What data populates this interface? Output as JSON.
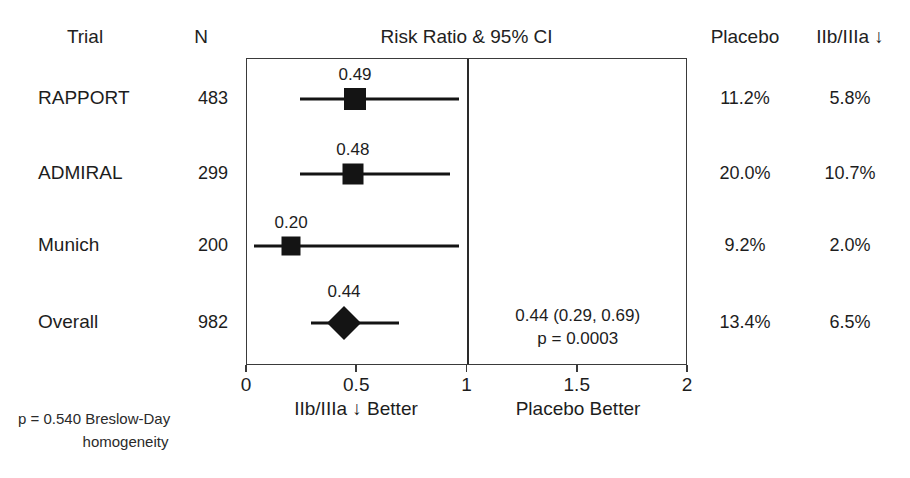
{
  "figure": {
    "width": 910,
    "height": 478,
    "background": "#ffffff",
    "ink": "#141414"
  },
  "headers": {
    "trial": "Trial",
    "n": "N",
    "plot_title": "Risk Ratio & 95% CI",
    "placebo": "Placebo",
    "active": "IIb/IIIa ↓"
  },
  "axis": {
    "min": 0,
    "max": 2,
    "null_value": 1,
    "ticks": [
      "0",
      "0.5",
      "1",
      "1.5",
      "2"
    ],
    "tick_values": [
      0,
      0.5,
      1,
      1.5,
      2
    ],
    "left_caption": "IIb/IIIa ↓ Better",
    "right_caption": "Placebo Better"
  },
  "rows": [
    {
      "trial": "RAPPORT",
      "n": "483",
      "estimate_label": "0.49",
      "estimate": 0.49,
      "ci_low": 0.24,
      "ci_high": 0.96,
      "marker": "square",
      "marker_size": 22,
      "placebo": "11.2%",
      "active": "5.8%"
    },
    {
      "trial": "ADMIRAL",
      "n": "299",
      "estimate_label": "0.48",
      "estimate": 0.48,
      "ci_low": 0.24,
      "ci_high": 0.92,
      "marker": "square",
      "marker_size": 21,
      "placebo": "20.0%",
      "active": "10.7%"
    },
    {
      "trial": "Munich",
      "n": "200",
      "estimate_label": "0.20",
      "estimate": 0.2,
      "ci_low": 0.03,
      "ci_high": 0.96,
      "marker": "square",
      "marker_size": 19,
      "placebo": "9.2%",
      "active": "2.0%"
    },
    {
      "trial": "Overall",
      "n": "982",
      "estimate_label": "0.44",
      "estimate": 0.44,
      "ci_low": 0.29,
      "ci_high": 0.69,
      "marker": "diamond",
      "marker_size": 34,
      "placebo": "13.4%",
      "active": "6.5%",
      "summary_line1": "0.44 (0.29, 0.69)",
      "summary_line2": "p = 0.0003"
    }
  ],
  "footnote": {
    "line1": "p = 0.540 Breslow-Day",
    "line2": "homogeneity"
  },
  "chart_data": {
    "type": "forest",
    "title": "Risk Ratio & 95% CI",
    "xlabel": "Risk Ratio",
    "ylabel": "",
    "xlim": [
      0,
      2
    ],
    "xticks": [
      0,
      0.5,
      1,
      1.5,
      2
    ],
    "xticklabels": [
      "0",
      "0.5",
      "1",
      "1.5",
      "2"
    ],
    "reference_line": 1,
    "grid": false,
    "legend": "none",
    "categories": [
      "RAPPORT",
      "ADMIRAL",
      "Munich",
      "Overall"
    ],
    "values": [
      0.49,
      0.48,
      0.2,
      0.44
    ],
    "ci_low": [
      0.24,
      0.24,
      0.03,
      0.29
    ],
    "ci_high": [
      0.96,
      0.92,
      0.96,
      0.69
    ],
    "n": [
      483,
      299,
      200,
      982
    ],
    "placebo_rate": [
      "11.2%",
      "20.0%",
      "9.2%",
      "13.4%"
    ],
    "active_rate": [
      "5.8%",
      "10.7%",
      "2.0%",
      "6.5%"
    ],
    "overall_estimate": "0.44 (0.29, 0.69)",
    "overall_p": "p = 0.0003",
    "heterogeneity": "p = 0.540 Breslow-Day homogeneity",
    "annotations": [
      "IIb/IIIa ↓ Better",
      "Placebo Better"
    ]
  }
}
